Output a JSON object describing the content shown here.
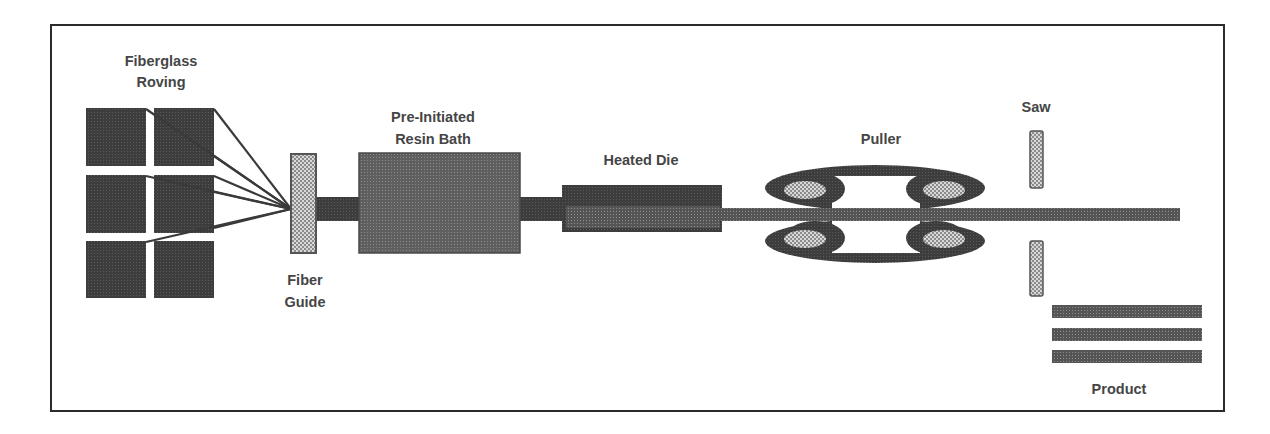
{
  "colors": {
    "frame": "#2b2b2b",
    "dark_fill": "#404040",
    "medium_fill": "#6a6a6a",
    "light_hatch": "#b8b8b8",
    "text": "#454545"
  },
  "stages": {
    "roving": {
      "line1": "Fiberglass",
      "line2": "Roving"
    },
    "fiber_guide": {
      "line1": "Fiber",
      "line2": "Guide"
    },
    "resin_bath": {
      "line1": "Pre-Initiated",
      "line2": "Resin Bath"
    },
    "heated_die": {
      "label": "Heated Die"
    },
    "puller": {
      "label": "Puller"
    },
    "saw": {
      "label": "Saw"
    },
    "product": {
      "label": "Product"
    }
  },
  "flow_order": [
    "Fiberglass Roving",
    "Fiber Guide",
    "Pre-Initiated Resin Bath",
    "Heated Die",
    "Puller",
    "Saw",
    "Product"
  ]
}
